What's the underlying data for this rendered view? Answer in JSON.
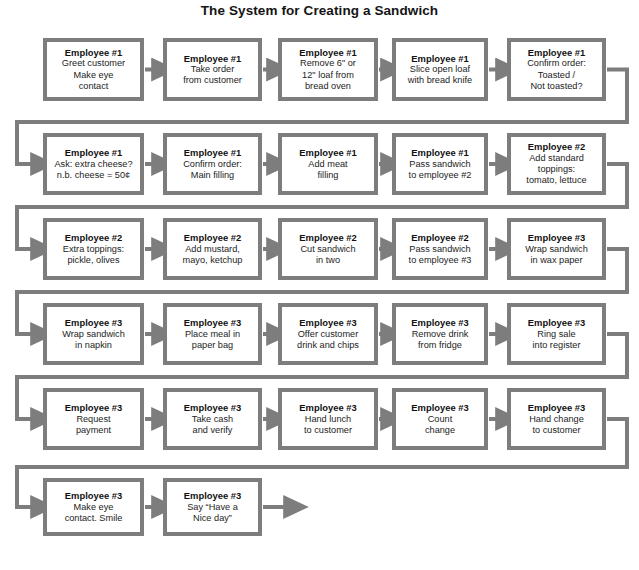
{
  "title": "The System for Creating a Sandwich",
  "style": {
    "border_color": "#7d7d7d",
    "connector_color": "#7d7d7d",
    "box_fill": "#ffffff",
    "page_background": "#ffffff",
    "text_color": "#141414"
  },
  "chart_data": {
    "type": "diagram",
    "diagram_type": "flowchart",
    "title": "The System for Creating a Sandwich",
    "flow_direction": "left-to-right, wrapping (boustrophedon rows connected by wrap-around connectors)",
    "row_count": 6,
    "node_count": 27,
    "nodes": [
      {
        "index": 1,
        "row": 1,
        "col": 1,
        "role": "Employee #1",
        "task": [
          "Greet customer",
          "Make eye",
          "contact"
        ]
      },
      {
        "index": 2,
        "row": 1,
        "col": 2,
        "role": "Employee #1",
        "task": [
          "Take order",
          "from customer"
        ]
      },
      {
        "index": 3,
        "row": 1,
        "col": 3,
        "role": "Employee #1",
        "task": [
          "Remove 6\" or",
          "12\" loaf from",
          "bread oven"
        ]
      },
      {
        "index": 4,
        "row": 1,
        "col": 4,
        "role": "Employee #1",
        "task": [
          "Slice open loaf",
          "with bread knife"
        ]
      },
      {
        "index": 5,
        "row": 1,
        "col": 5,
        "role": "Employee #1",
        "task": [
          "Confirm order:",
          "Toasted /",
          "Not toasted?"
        ]
      },
      {
        "index": 6,
        "row": 2,
        "col": 1,
        "role": "Employee #1",
        "task": [
          "Ask: extra cheese?",
          "n.b. cheese = 50¢"
        ]
      },
      {
        "index": 7,
        "row": 2,
        "col": 2,
        "role": "Employee #1",
        "task": [
          "Confirm order:",
          "Main filling"
        ]
      },
      {
        "index": 8,
        "row": 2,
        "col": 3,
        "role": "Employee #1",
        "task": [
          "Add meat",
          "filling"
        ]
      },
      {
        "index": 9,
        "row": 2,
        "col": 4,
        "role": "Employee #1",
        "task": [
          "Pass sandwich",
          "to employee #2"
        ]
      },
      {
        "index": 10,
        "row": 2,
        "col": 5,
        "role": "Employee #2",
        "task": [
          "Add standard",
          "toppings:",
          "tomato, lettuce"
        ]
      },
      {
        "index": 11,
        "row": 3,
        "col": 1,
        "role": "Employee #2",
        "task": [
          "Extra toppings:",
          "pickle, olives"
        ]
      },
      {
        "index": 12,
        "row": 3,
        "col": 2,
        "role": "Employee #2",
        "task": [
          "Add mustard,",
          "mayo, ketchup"
        ]
      },
      {
        "index": 13,
        "row": 3,
        "col": 3,
        "role": "Employee #2",
        "task": [
          "Cut sandwich",
          "in two"
        ]
      },
      {
        "index": 14,
        "row": 3,
        "col": 4,
        "role": "Employee #2",
        "task": [
          "Pass sandwich",
          "to employee #3"
        ]
      },
      {
        "index": 15,
        "row": 3,
        "col": 5,
        "role": "Employee #3",
        "task": [
          "Wrap sandwich",
          "in wax paper"
        ]
      },
      {
        "index": 16,
        "row": 4,
        "col": 1,
        "role": "Employee #3",
        "task": [
          "Wrap sandwich",
          "in napkin"
        ]
      },
      {
        "index": 17,
        "row": 4,
        "col": 2,
        "role": "Employee #3",
        "task": [
          "Place meal in",
          "paper bag"
        ]
      },
      {
        "index": 18,
        "row": 4,
        "col": 3,
        "role": "Employee #3",
        "task": [
          "Offer customer",
          "drink and chips"
        ]
      },
      {
        "index": 19,
        "row": 4,
        "col": 4,
        "role": "Employee #3",
        "task": [
          "Remove drink",
          "from fridge"
        ]
      },
      {
        "index": 20,
        "row": 4,
        "col": 5,
        "role": "Employee #3",
        "task": [
          "Ring sale",
          "into register"
        ]
      },
      {
        "index": 21,
        "row": 5,
        "col": 1,
        "role": "Employee #3",
        "task": [
          "Request",
          "payment"
        ]
      },
      {
        "index": 22,
        "row": 5,
        "col": 2,
        "role": "Employee #3",
        "task": [
          "Take cash",
          "and verify"
        ]
      },
      {
        "index": 23,
        "row": 5,
        "col": 3,
        "role": "Employee #3",
        "task": [
          "Hand lunch",
          "to customer"
        ]
      },
      {
        "index": 24,
        "row": 5,
        "col": 4,
        "role": "Employee #3",
        "task": [
          "Count",
          "change"
        ]
      },
      {
        "index": 25,
        "row": 5,
        "col": 5,
        "role": "Employee #3",
        "task": [
          "Hand change",
          "to customer"
        ]
      },
      {
        "index": 26,
        "row": 6,
        "col": 1,
        "role": "Employee #3",
        "task": [
          "Make eye",
          "contact. Smile"
        ]
      },
      {
        "index": 27,
        "row": 6,
        "col": 2,
        "role": "Employee #3",
        "task": [
          "Say “Have a",
          "Nice day”"
        ]
      }
    ]
  }
}
